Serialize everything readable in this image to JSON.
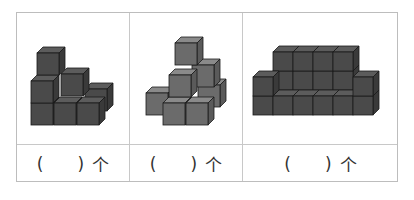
{
  "worksheet": {
    "title": "Count the cubes",
    "columns": [
      {
        "figure": "cube-stack-1",
        "open_paren": "(",
        "close_paren": ")",
        "unit": "个",
        "answer": ""
      },
      {
        "figure": "cube-stack-2",
        "open_paren": "(",
        "close_paren": ")",
        "unit": "个",
        "answer": ""
      },
      {
        "figure": "cube-stack-3",
        "open_paren": "(",
        "close_paren": ")",
        "unit": "个",
        "answer": ""
      }
    ],
    "colors": {
      "border": "#bdbdbd",
      "cube_front": "#4a4a4a",
      "cube_top": "#5c5c5c",
      "cube_side": "#3a3a3a",
      "cube2_front": "#6b6b6b",
      "cube_edge": "#1a1a1a"
    }
  }
}
